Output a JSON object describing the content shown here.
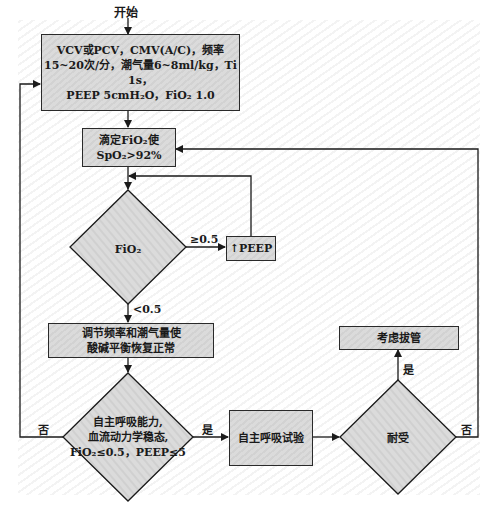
{
  "diagram": {
    "start_label": "开始",
    "box_initial": {
      "line1": "VCV或PCV，CMV(A/C)，频率",
      "line2": "15~20次/分，潮气量6~8ml/kg，Ti 1s，",
      "line3": "PEEP 5cmH₂O，FiO₂ 1.0"
    },
    "box_titrate": {
      "line1": "滴定FiO₂使",
      "line2": "SpO₂>92%"
    },
    "decision_fio2": {
      "label": "FiO₂",
      "high_branch": "≥0.5",
      "low_branch": "<0.5"
    },
    "box_peep": {
      "label": "↑PEEP"
    },
    "box_adjust": {
      "line1": "调节频率和潮气量使",
      "line2": "酸碱平衡恢复正常"
    },
    "decision_readiness": {
      "line1": "自主呼吸能力,",
      "line2": "血流动力学稳态,",
      "line3": "FiO₂≤0.5，PEEP≤5",
      "yes": "是",
      "no": "否"
    },
    "box_sbt": {
      "label": "自主呼吸试验"
    },
    "decision_tolerance": {
      "label": "耐受",
      "yes": "是",
      "no": "否"
    },
    "box_extubate": {
      "label": "考虑拔管"
    },
    "colors": {
      "box_fill": "#d6d6d6",
      "line": "#1a1a1a",
      "background_stripe": "#f3f3f3"
    }
  }
}
